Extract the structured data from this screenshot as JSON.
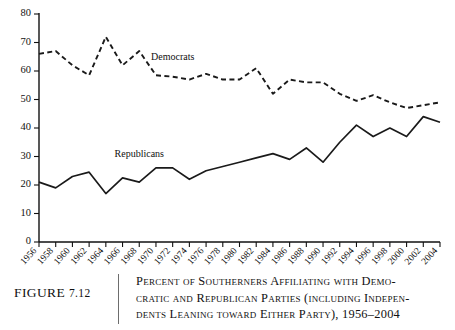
{
  "figure": {
    "number_label": "FIGURE",
    "number": "7.12",
    "caption_line1": "Percent of Southerners Affiliating with Demo-",
    "caption_line2": "cratic and Republican Parties (including Indepen-",
    "caption_line3": "dents Leaning toward Either Party), 1956–2004"
  },
  "chart_data": {
    "type": "line",
    "xlabel": "",
    "ylabel": "",
    "xlim": [
      1956,
      2004
    ],
    "ylim": [
      0,
      80
    ],
    "yticks": [
      0,
      10,
      20,
      30,
      40,
      50,
      60,
      70,
      80
    ],
    "ytick_labels": [
      "0",
      "10",
      "20",
      "30",
      "40",
      "50",
      "60",
      "70",
      "80"
    ],
    "grid": false,
    "legend": "inline-labels",
    "categories": [
      1956,
      1958,
      1960,
      1962,
      1964,
      1966,
      1968,
      1970,
      1972,
      1974,
      1976,
      1978,
      1980,
      1982,
      1984,
      1986,
      1988,
      1990,
      1992,
      1994,
      1996,
      1998,
      2000,
      2002,
      2004
    ],
    "xtick_labels": [
      "1956",
      "1958",
      "1960",
      "1962",
      "1964",
      "1966",
      "1968",
      "1970",
      "1972",
      "1974",
      "1976",
      "1978",
      "1980",
      "1982",
      "1984",
      "1986",
      "1988",
      "1990",
      "1992",
      "1994",
      "1996",
      "1998",
      "2000",
      "2002",
      "2004"
    ],
    "series": [
      {
        "name": "Democrats",
        "style": "dashed",
        "color": "#1a1a1a",
        "label_x": 1972,
        "label_y": 64,
        "values": [
          66,
          67,
          62,
          58.5,
          72,
          62,
          67,
          58.5,
          58,
          57,
          59,
          57,
          57,
          61,
          52,
          57,
          56,
          56,
          52,
          49.5,
          51.5,
          49,
          47,
          48,
          49
        ]
      },
      {
        "name": "Republicans",
        "style": "solid",
        "color": "#1a1a1a",
        "label_x": 1968,
        "label_y": 30,
        "values": [
          21,
          19,
          23,
          24.5,
          17,
          22.5,
          21,
          26,
          26,
          22,
          25,
          26.5,
          28,
          29.5,
          31,
          29,
          33,
          28,
          35,
          41,
          37,
          40,
          37,
          44,
          42
        ]
      }
    ]
  }
}
